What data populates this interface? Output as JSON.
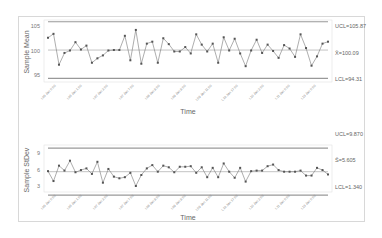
{
  "chart_data": [
    {
      "type": "line",
      "title": "",
      "xlabel": "Time",
      "ylabel": "Sample Mean",
      "ylim": [
        93.5,
        106.5
      ],
      "yticks": [
        95,
        100,
        105
      ],
      "grid": false,
      "x_tick_labels": [
        "L05 Jan 0:00",
        "L06 Jan 1:00",
        "L07 Jan 3:00",
        "L07 Jan 7:00",
        "L08 Jan 8:00",
        "L09 Jan 8:00",
        "L09 Jan 11:00",
        "L10 Jan 17:00",
        "L10 Jan 2:00",
        "L11 Jan 0:00",
        "L13 Jan 0:00"
      ],
      "control_limits": {
        "UCL": 105.87,
        "center": 100.09,
        "LCL": 94.31
      },
      "control_labels": {
        "UCL": "UCL=105.87",
        "center": "X̄=100.09",
        "LCL": "LCL=94.31"
      },
      "series": [
        {
          "name": "Sample Mean",
          "values": [
            102.6,
            103.4,
            97.1,
            99.5,
            100.0,
            101.7,
            100.2,
            101.0,
            97.5,
            98.4,
            99.0,
            100.0,
            100.1,
            100.1,
            103.0,
            98.0,
            104.2,
            97.3,
            101.4,
            101.8,
            97.5,
            102.5,
            101.3,
            99.8,
            99.8,
            100.7,
            99.4,
            103.3,
            101.2,
            99.8,
            101.4,
            97.5,
            102.7,
            100.0,
            102.4,
            99.4,
            96.8,
            100.0,
            102.2,
            99.5,
            101.2,
            99.9,
            98.5,
            101.1,
            100.4,
            98.7,
            103.3,
            100.5,
            96.9,
            98.8,
            101.4,
            101.8
          ]
        }
      ]
    },
    {
      "type": "line",
      "title": "",
      "xlabel": "Time",
      "ylabel": "Sample StDev",
      "ylim": [
        0.5,
        10
      ],
      "yticks": [
        3,
        6,
        9
      ],
      "grid": false,
      "x_tick_labels": [
        "L05 Jan 0:00",
        "L06 Jan 1:00",
        "L07 Jan 3:00",
        "L07 Jan 7:00",
        "L08 Jan 8:00",
        "L09 Jan 8:00",
        "L09 Jan 11:00",
        "L10 Jan 17:00",
        "L10 Jan 2:00",
        "L11 Jan 0:00",
        "L13 Jan 0:00"
      ],
      "control_limits": {
        "UCL": 9.87,
        "center": 5.605,
        "LCL": 1.34
      },
      "control_labels": {
        "UCL": "UCL=9.870",
        "center": "S̄=5.605",
        "LCL": "LCL=1.340"
      },
      "series": [
        {
          "name": "Sample StDev",
          "values": [
            5.7,
            3.9,
            6.7,
            5.8,
            7.6,
            5.5,
            5.9,
            6.2,
            5.2,
            7.4,
            3.6,
            6.1,
            4.7,
            4.4,
            4.6,
            5.4,
            3.0,
            5.0,
            6.2,
            6.8,
            5.6,
            6.7,
            6.4,
            5.5,
            6.5,
            6.5,
            6.6,
            5.4,
            6.4,
            4.6,
            6.3,
            4.6,
            7.1,
            5.6,
            4.5,
            6.3,
            3.8,
            5.7,
            5.8,
            5.8,
            6.6,
            6.9,
            5.9,
            5.6,
            5.6,
            5.6,
            5.8,
            4.9,
            4.9,
            6.3,
            5.9,
            5.1
          ]
        }
      ]
    }
  ],
  "panels": {
    "top": {
      "ylabel": "Sample Mean",
      "xlabel": "Time",
      "yticks": [
        "105",
        "100",
        "95"
      ],
      "ucl": "UCL=105.87",
      "center": "X̄=100.09",
      "lcl": "LCL=94.31"
    },
    "bottom": {
      "ylabel": "Sample StDev",
      "xlabel": "Time",
      "yticks": [
        "9",
        "6",
        "3"
      ],
      "ucl": "UCL=9.870",
      "center": "S̄=5.605",
      "lcl": "LCL=1.340"
    }
  },
  "colors": {
    "line": "#777777",
    "marker": "#555555",
    "limit": "#999999",
    "center": "#aaaaaa"
  }
}
